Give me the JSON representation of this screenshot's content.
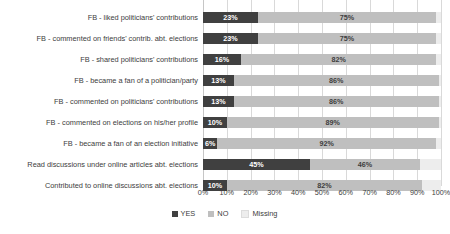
{
  "chart_data": {
    "type": "bar",
    "orientation": "horizontal",
    "stacked": true,
    "title": "",
    "xlabel": "",
    "ylabel": "",
    "xlim": [
      0,
      100
    ],
    "grid": true,
    "legend_position": "bottom",
    "tick_labels": [
      "0%",
      "10%",
      "20%",
      "30%",
      "40%",
      "50%",
      "60%",
      "70%",
      "80%",
      "90%",
      "100%"
    ],
    "tick_values": [
      0,
      10,
      20,
      30,
      40,
      50,
      60,
      70,
      80,
      90,
      100
    ],
    "legend": [
      "YES",
      "NO",
      "Missing"
    ],
    "categories": [
      "FB - liked politicians' contributions",
      "FB - commented on friends' contrib. abt. elections",
      "FB - shared politicians' contributions",
      "FB - became a fan of a politician/party",
      "FB - commented on politicians' contributions",
      "FB - commented on elections on his/her profile",
      "FB - became a fan of an election initiative",
      "Read discussions under online articles abt. elections",
      "Contributed to online discussions abt. elections"
    ],
    "series": [
      {
        "name": "YES",
        "values": [
          23,
          23,
          16,
          13,
          13,
          10,
          6,
          45,
          10
        ]
      },
      {
        "name": "NO",
        "values": [
          75,
          75,
          82,
          86,
          86,
          89,
          92,
          46,
          82
        ]
      },
      {
        "name": "Missing",
        "values": [
          2,
          2,
          2,
          1,
          1,
          1,
          2,
          9,
          8
        ]
      }
    ],
    "data_labels": {
      "YES": [
        "23%",
        "23%",
        "16%",
        "13%",
        "13%",
        "10%",
        "6%",
        "45%",
        "10%"
      ],
      "NO": [
        "75%",
        "75%",
        "82%",
        "86%",
        "86%",
        "89%",
        "92%",
        "46%",
        "82%"
      ],
      "Missing": [
        "",
        "",
        "",
        "",
        "",
        "",
        "",
        "",
        ""
      ]
    },
    "colors": {
      "YES": "#404040",
      "NO": "#bfbfbf",
      "Missing": "#ededed",
      "gridline": "#d9d9d9",
      "text": "#3d3d3d",
      "background": "#ffffff"
    }
  }
}
